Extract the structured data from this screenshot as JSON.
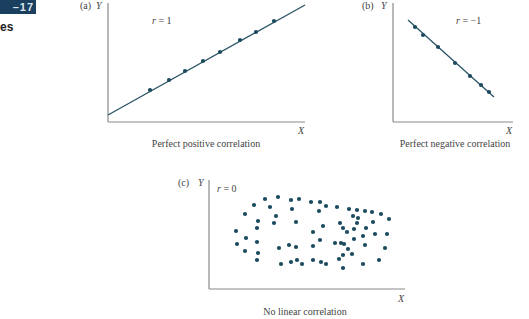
{
  "header": {
    "badge_text": "–17",
    "section_fragment": "es"
  },
  "colors": {
    "badge": "#1b3f5e",
    "dot": "#1c4a5e",
    "line": "#2a5466",
    "axis": "#8a8a8a"
  },
  "chart_data": [
    {
      "type": "scatter",
      "panel_label": "(a)",
      "title": "Perfect positive correlation",
      "r_label": "r = 1",
      "xlabel": "X",
      "ylabel": "Y",
      "grid": false,
      "fit_line": {
        "from": [
          108,
          115
        ],
        "to": [
          305,
          5
        ]
      },
      "axes": {
        "origin": [
          108,
          122
        ],
        "x_end": 305,
        "y_top": 3
      },
      "points": [
        [
          150,
          90
        ],
        [
          169,
          80
        ],
        [
          185,
          71
        ],
        [
          203,
          61
        ],
        [
          220,
          52
        ],
        [
          240,
          40
        ],
        [
          256,
          32
        ],
        [
          274,
          21
        ]
      ],
      "label_pos": {
        "panel": [
          80,
          9
        ],
        "y": [
          96,
          9
        ],
        "r": [
          152,
          24
        ],
        "x": [
          298,
          134
        ],
        "caption": [
          206,
          147
        ]
      }
    },
    {
      "type": "scatter",
      "panel_label": "(b)",
      "title": "Perfect negative correlation",
      "r_label": "r = −1",
      "xlabel": "X",
      "ylabel": "Y",
      "grid": false,
      "fit_line": {
        "from": [
          408,
          20
        ],
        "to": [
          494,
          97
        ]
      },
      "axes": {
        "origin": [
          393,
          122
        ],
        "x_end": 513,
        "y_top": 3
      },
      "points": [
        [
          415,
          27
        ],
        [
          423,
          35
        ],
        [
          438,
          47
        ],
        [
          455,
          63
        ],
        [
          470,
          76
        ],
        [
          481,
          85
        ],
        [
          489,
          92
        ]
      ],
      "label_pos": {
        "panel": [
          362,
          9
        ],
        "y": [
          381,
          9
        ],
        "r": [
          456,
          24
        ],
        "x": [
          506,
          134
        ],
        "caption": [
          455,
          147
        ]
      }
    },
    {
      "type": "scatter",
      "panel_label": "(c)",
      "title": "No linear correlation",
      "r_label": "r = 0",
      "xlabel": "X",
      "ylabel": "Y",
      "grid": false,
      "fit_line": null,
      "axes": {
        "origin": [
          209,
          289
        ],
        "x_end": 405,
        "y_top": 180
      },
      "points": [
        [
          254,
          205
        ],
        [
          265,
          199
        ],
        [
          278,
          197
        ],
        [
          291,
          200
        ],
        [
          299,
          199
        ],
        [
          270,
          207
        ],
        [
          292,
          209
        ],
        [
          245,
          214
        ],
        [
          276,
          216
        ],
        [
          258,
          221
        ],
        [
          274,
          223
        ],
        [
          296,
          222
        ],
        [
          236,
          231
        ],
        [
          257,
          228
        ],
        [
          246,
          238
        ],
        [
          237,
          244
        ],
        [
          257,
          242
        ],
        [
          279,
          248
        ],
        [
          289,
          245
        ],
        [
          296,
          247
        ],
        [
          245,
          251
        ],
        [
          258,
          253
        ],
        [
          257,
          260
        ],
        [
          281,
          264
        ],
        [
          291,
          262
        ],
        [
          297,
          260
        ],
        [
          302,
          264
        ],
        [
          311,
          202
        ],
        [
          320,
          202
        ],
        [
          319,
          211
        ],
        [
          326,
          206
        ],
        [
          337,
          207
        ],
        [
          349,
          209
        ],
        [
          357,
          210
        ],
        [
          365,
          211
        ],
        [
          372,
          212
        ],
        [
          381,
          214
        ],
        [
          389,
          219
        ],
        [
          353,
          216
        ],
        [
          358,
          218
        ],
        [
          357,
          223
        ],
        [
          340,
          223
        ],
        [
          323,
          226
        ],
        [
          343,
          228
        ],
        [
          354,
          229
        ],
        [
          366,
          228
        ],
        [
          373,
          222
        ],
        [
          313,
          232
        ],
        [
          347,
          232
        ],
        [
          363,
          236
        ],
        [
          375,
          234
        ],
        [
          387,
          234
        ],
        [
          354,
          239
        ],
        [
          320,
          240
        ],
        [
          335,
          243
        ],
        [
          341,
          243
        ],
        [
          344,
          244
        ],
        [
          365,
          245
        ],
        [
          313,
          246
        ],
        [
          348,
          249
        ],
        [
          385,
          248
        ],
        [
          343,
          255
        ],
        [
          352,
          254
        ],
        [
          339,
          259
        ],
        [
          379,
          260
        ],
        [
          313,
          260
        ],
        [
          321,
          262
        ],
        [
          326,
          264
        ],
        [
          343,
          268
        ],
        [
          363,
          264
        ]
      ],
      "label_pos": {
        "panel": [
          178,
          186
        ],
        "y": [
          198,
          186
        ],
        "r": [
          217,
          192
        ],
        "x": [
          398,
          302
        ],
        "caption": [
          305,
          315
        ]
      }
    }
  ]
}
